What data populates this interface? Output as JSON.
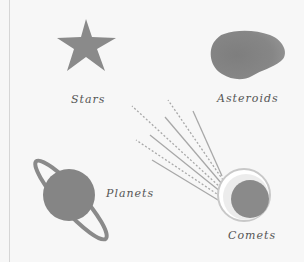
{
  "labels": {
    "stars": "Stars",
    "asteroids": "Asteroids",
    "planets": "Planets",
    "comets": "Comets"
  },
  "colors": {
    "background": "#f7f7f7",
    "shape_fill": "#8a8a8a",
    "comet_ring": "#cfcfcf",
    "tail_lines": "#a8a8a8",
    "text": "#555555"
  },
  "icons": [
    "star-icon",
    "asteroid-icon",
    "planet-icon",
    "comet-icon"
  ]
}
